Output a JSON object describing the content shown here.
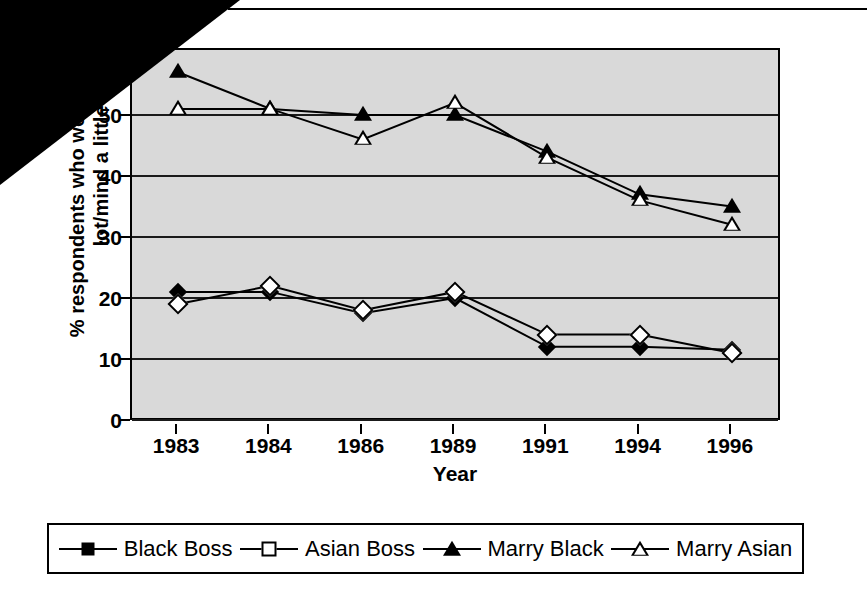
{
  "chart_data": {
    "type": "line",
    "title": "",
    "xlabel": "Year",
    "ylabel_lines": [
      "% respondents who would mind a",
      "lot/mind a little"
    ],
    "categories": [
      "1983",
      "1984",
      "1986",
      "1989",
      "1991",
      "1994",
      "1996"
    ],
    "ylim": [
      0,
      60
    ],
    "ytick_labels": [
      "0",
      "10",
      "20",
      "30",
      "40",
      "50"
    ],
    "ytick_values": [
      0,
      10,
      20,
      30,
      40,
      50
    ],
    "grid": true,
    "legend_position": "bottom",
    "plot_background": "#d9d9d9",
    "series": [
      {
        "name": "Black Boss",
        "marker": "diamond-filled",
        "values": [
          21,
          21,
          17.5,
          20,
          12,
          12,
          11.5
        ]
      },
      {
        "name": "Asian Boss",
        "marker": "diamond-hollow",
        "values": [
          19,
          22,
          18,
          21,
          14,
          14,
          11
        ]
      },
      {
        "name": "Marry Black",
        "marker": "triangle-filled",
        "values": [
          57,
          51,
          50,
          50,
          44,
          37,
          35
        ]
      },
      {
        "name": "Marry Asian",
        "marker": "triangle-hollow",
        "values": [
          51,
          51,
          46,
          52,
          43,
          36,
          32
        ]
      }
    ]
  },
  "legend": {
    "items": [
      {
        "label": "Black Boss",
        "marker": "diamond-filled"
      },
      {
        "label": "Asian Boss",
        "marker": "diamond-hollow"
      },
      {
        "label": "Marry Black",
        "marker": "triangle-filled"
      },
      {
        "label": "Marry Asian",
        "marker": "triangle-hollow"
      }
    ]
  },
  "artifact": {
    "note": "black-scan-wedge-top-left"
  }
}
